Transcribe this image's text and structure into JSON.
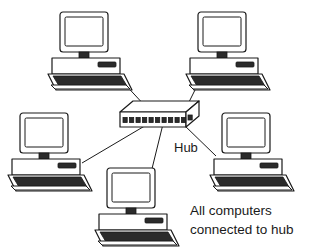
{
  "diagram": {
    "type": "network-topology",
    "topology": "star",
    "background_color": "#ffffff",
    "line_color": "#1a1a1a",
    "fill_color": "#ffffff",
    "accent_dark": "#2b2b2b",
    "hub": {
      "label": "Hub",
      "label_x": 174,
      "label_y": 152,
      "port_count": 11,
      "center": {
        "x": 155,
        "y": 118
      }
    },
    "caption": {
      "line1": "All computers",
      "line2": "connected to hub"
    },
    "nodes": [
      {
        "id": "pc-top-left",
        "name": "computer-top-left",
        "position": "top-left",
        "x": 50,
        "y": 12,
        "connects_to": "hub"
      },
      {
        "id": "pc-top-right",
        "name": "computer-top-right",
        "position": "top-right",
        "x": 188,
        "y": 12,
        "connects_to": "hub"
      },
      {
        "id": "pc-left",
        "name": "computer-left",
        "position": "left",
        "x": 10,
        "y": 113,
        "connects_to": "hub"
      },
      {
        "id": "pc-right",
        "name": "computer-right",
        "position": "right",
        "x": 212,
        "y": 113,
        "connects_to": "hub"
      },
      {
        "id": "pc-bottom",
        "name": "computer-bottom",
        "position": "bottom-center",
        "x": 97,
        "y": 168,
        "connects_to": "hub"
      }
    ],
    "links": [
      {
        "id": "link-top-left",
        "from": "pc-top-left",
        "to": "hub"
      },
      {
        "id": "link-top-right",
        "from": "pc-top-right",
        "to": "hub"
      },
      {
        "id": "link-left",
        "from": "pc-left",
        "to": "hub"
      },
      {
        "id": "link-right",
        "from": "pc-right",
        "to": "hub"
      },
      {
        "id": "link-bottom",
        "from": "pc-bottom",
        "to": "hub"
      }
    ]
  }
}
